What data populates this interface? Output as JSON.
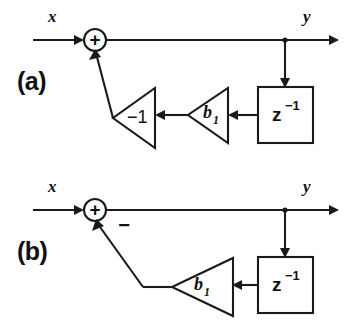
{
  "figure": {
    "background_color": "#ffffff",
    "line_color": "#1a1a1a"
  },
  "panels": [
    {
      "id": "a",
      "label": "(a)",
      "input_label": "x",
      "output_label": "y",
      "adder_sign": "+",
      "blocks": [
        {
          "name": "inverter",
          "label": "−1",
          "type": "triangle-gain"
        },
        {
          "name": "coefficient-gain",
          "label": "b",
          "subscript": "1",
          "type": "triangle-gain"
        },
        {
          "name": "unit-delay",
          "label": "z",
          "superscript": "−1",
          "type": "box-delay"
        }
      ]
    },
    {
      "id": "b",
      "label": "(b)",
      "input_label": "x",
      "output_label": "y",
      "adder_sign": "+",
      "feedback_sign": "−",
      "blocks": [
        {
          "name": "coefficient-gain",
          "label": "b",
          "subscript": "1",
          "type": "triangle-gain"
        },
        {
          "name": "unit-delay",
          "label": "z",
          "superscript": "−1",
          "type": "box-delay"
        }
      ]
    }
  ]
}
